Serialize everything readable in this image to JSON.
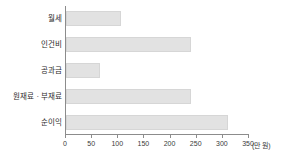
{
  "chart_data": {
    "type": "bar",
    "orientation": "horizontal",
    "title": "",
    "subtitle": "",
    "xlabel": "",
    "ylabel": "",
    "unit_label": "(만 원)",
    "categories": [
      "월세",
      "인건비",
      "공과금",
      "원재료 · 부재료",
      "순이익"
    ],
    "values": [
      105,
      240,
      65,
      240,
      310
    ],
    "series": [
      {
        "name": "금액",
        "values": [
          105,
          240,
          65,
          240,
          310
        ]
      }
    ],
    "xlim": [
      0,
      350
    ],
    "ylim": null,
    "xticks": [
      0,
      50,
      100,
      150,
      200,
      250,
      300,
      350
    ],
    "xtick_labels": [
      "0",
      "50",
      "100",
      "150",
      "200",
      "250",
      "300",
      "350"
    ],
    "grid": false,
    "legend": false,
    "legend_position": "none",
    "bar_color": "#e2e2e2",
    "bar_border_color": "#d6d6d6",
    "axis_color": "#8c8c8c",
    "text_color": "#2b2b2b"
  }
}
